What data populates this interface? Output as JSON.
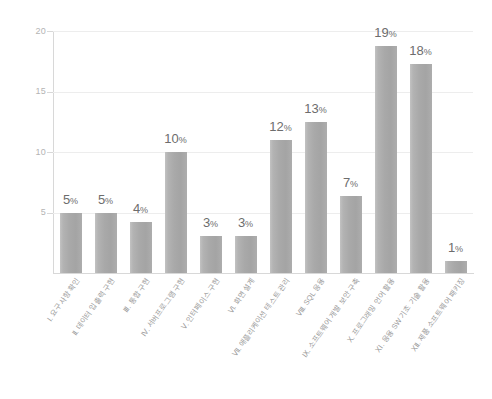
{
  "chart_data": {
    "type": "bar",
    "title": "",
    "subtitle": "",
    "xlabel": "",
    "ylabel": "",
    "ylim": [
      0,
      20
    ],
    "yticks": [
      5,
      10,
      15,
      20
    ],
    "grid": true,
    "legend": "none",
    "categories": [
      "Ⅰ. 요구사항 확인",
      "Ⅱ. 데이터 입출력 구현",
      "Ⅲ. 통합 구현",
      "Ⅳ. 서버프로그램 구현",
      "Ⅴ. 인터페이스 구현",
      "Ⅵ. 화면 설계",
      "Ⅶ. 애플리케이션 테스트 관리",
      "Ⅷ. SQL 응용",
      "Ⅸ. 소프트웨어 개발 보안 구축",
      "Ⅹ. 프로그래밍 언어 활용",
      "ⅩⅠ. 응용 SW 기초 기술 활용",
      "ⅩⅡ. 제품 소프트웨어 패키징"
    ],
    "values": [
      5,
      5,
      4,
      10,
      3,
      3,
      12,
      13,
      7,
      19,
      18,
      1
    ],
    "bar_heights": [
      5.0,
      5.0,
      4.2,
      10.0,
      3.1,
      3.1,
      11.0,
      12.5,
      6.4,
      18.8,
      17.3,
      1.0
    ],
    "data_labels": [
      "5%",
      "5%",
      "4%",
      "10%",
      "3%",
      "3%",
      "12%",
      "13%",
      "7%",
      "19%",
      "18%",
      "1%"
    ],
    "unit": "%",
    "colors": {
      "bar": "#a8a8a8",
      "bar_light": "#c2c2c2",
      "grid": "#ededed",
      "axis": "#d8d8d8",
      "tick_text": "#b4b4b4",
      "label_text": "#6d6d6d",
      "category_text": "#9a9a9a",
      "background": "#ffffff"
    }
  }
}
